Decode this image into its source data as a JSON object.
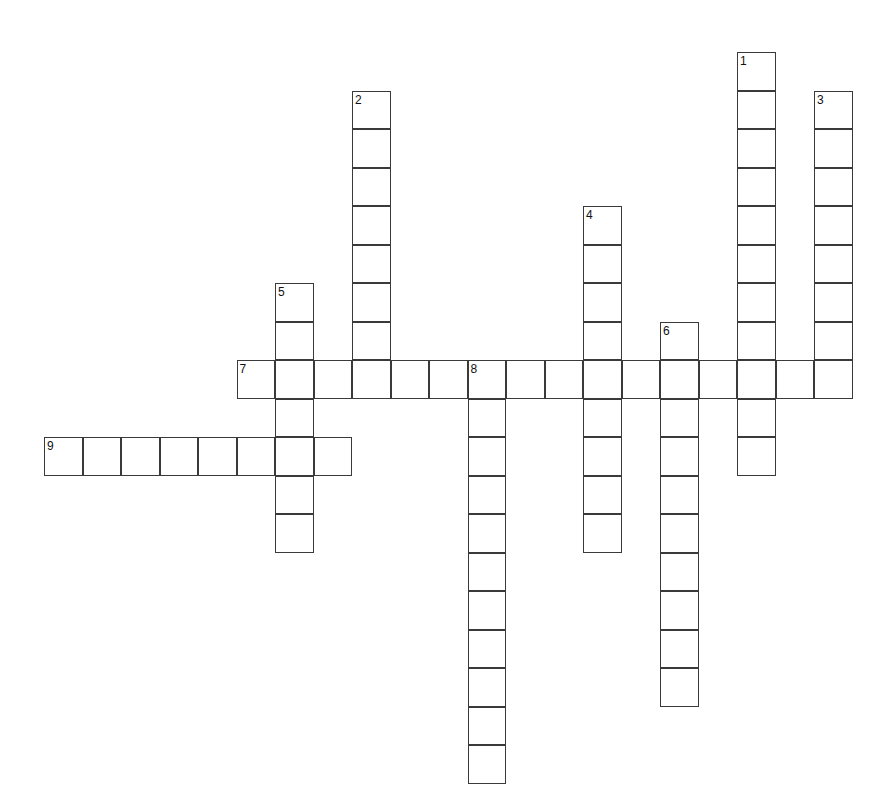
{
  "puzzle": {
    "title": "Crossword Puzzle Grid",
    "background_color": "#ffffff",
    "cell_border_color": "#3a3a3a",
    "cell_fill_color": "#ffffff",
    "number_color": "#111111",
    "cell_size": 38.5,
    "origin": {
      "x": 44,
      "y": 52
    },
    "grid_columns": 21,
    "grid_rows": 19,
    "entries": [
      {
        "number": "1",
        "direction": "down",
        "col": 18,
        "row": 0,
        "length": 11,
        "letters": [
          "",
          "",
          "",
          "",
          "",
          "",
          "",
          "",
          "",
          "",
          ""
        ]
      },
      {
        "number": "2",
        "direction": "down",
        "col": 8,
        "row": 1,
        "length": 8,
        "letters": [
          "",
          "",
          "",
          "",
          "",
          "",
          "",
          ""
        ]
      },
      {
        "number": "3",
        "direction": "down",
        "col": 20,
        "row": 1,
        "length": 8,
        "letters": [
          "",
          "",
          "",
          "",
          "",
          "",
          "",
          ""
        ]
      },
      {
        "number": "4",
        "direction": "down",
        "col": 14,
        "row": 4,
        "length": 9,
        "letters": [
          "",
          "",
          "",
          "",
          "",
          "",
          "",
          "",
          ""
        ]
      },
      {
        "number": "5",
        "direction": "down",
        "col": 6,
        "row": 6,
        "length": 7,
        "letters": [
          "",
          "",
          "",
          "",
          "",
          "",
          ""
        ]
      },
      {
        "number": "6",
        "direction": "down",
        "col": 16,
        "row": 7,
        "length": 10,
        "letters": [
          "",
          "",
          "",
          "",
          "",
          "",
          "",
          "",
          "",
          ""
        ]
      },
      {
        "number": "7",
        "direction": "across",
        "col": 5,
        "row": 8,
        "length": 16,
        "letters": [
          "",
          "",
          "",
          "",
          "",
          "",
          "",
          "",
          "",
          "",
          "",
          "",
          "",
          "",
          "",
          ""
        ]
      },
      {
        "number": "8",
        "direction": "down",
        "col": 11,
        "row": 8,
        "length": 11,
        "letters": [
          "",
          "",
          "",
          "",
          "",
          "",
          "",
          "",
          "",
          "",
          ""
        ]
      },
      {
        "number": "9",
        "direction": "across",
        "col": 0,
        "row": 10,
        "length": 8,
        "letters": [
          "",
          "",
          "",
          "",
          "",
          "",
          "",
          ""
        ]
      }
    ]
  }
}
